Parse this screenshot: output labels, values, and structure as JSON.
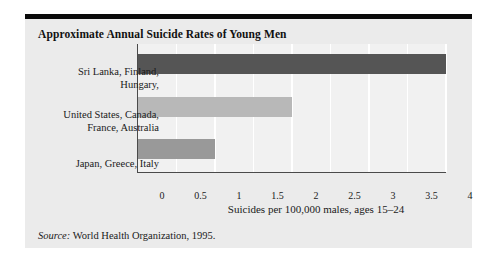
{
  "figure": {
    "title": "Approximate Annual Suicide Rates of Young Men",
    "source_label": "Source:",
    "source_text": "World Health Organization, 1995."
  },
  "colors": {
    "card_background": "#ebebeb",
    "plot_background": "#f1f1f1",
    "gridline": "#ffffff",
    "axis": "#4a4a4a",
    "top_rule": "#0a0a0a",
    "bar_high": "#555555",
    "bar_mid": "#999999",
    "bar_low": "#b8b8b8",
    "text": "#1a1a1a"
  },
  "chart_data": {
    "type": "bar",
    "orientation": "horizontal",
    "title": "Approximate Annual Suicide Rates of Young Men",
    "subtitle": "",
    "xlabel": "Suicides per 100,000 males, ages 15–24",
    "ylabel": "",
    "xlim": [
      0,
      4
    ],
    "xticks": [
      0,
      0.5,
      1,
      1.5,
      2,
      2.5,
      3,
      3.5,
      4
    ],
    "xtick_labels": [
      "0",
      "0.5",
      "1",
      "1.5",
      "2",
      "2.5",
      "3",
      "3.5",
      "4"
    ],
    "grid": "vertical-white",
    "legend": "none",
    "categories": [
      "Sri Lanka, Finland,\nHungary,",
      "United States, Canada,\nFrance, Australia",
      "Japan, Greece, Italy"
    ],
    "values": [
      4,
      2,
      1
    ],
    "bar_colors": [
      "#555555",
      "#b8b8b8",
      "#999999"
    ],
    "annotations": [],
    "source": "Source: World Health Organization, 1995."
  }
}
